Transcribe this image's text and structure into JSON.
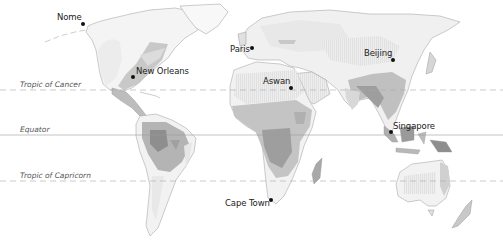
{
  "map": {
    "type": "world-climate-shading",
    "colors": {
      "background": "#ffffff",
      "land_base": "#f4f4f4",
      "land_light": "#e6e6e6",
      "land_medium": "#c8c8c8",
      "land_dark": "#a8a8a8",
      "land_darkest": "#8e8e8e",
      "coast": "#9a9a9a",
      "lat_line": "#9a9a9a"
    },
    "latitude_lines": [
      {
        "name": "Tropic of Cancer",
        "y": 90,
        "style": "dashed"
      },
      {
        "name": "Equator",
        "y": 135,
        "style": "solid"
      },
      {
        "name": "Tropic of Capricorn",
        "y": 181,
        "style": "dashed"
      }
    ],
    "cities": [
      {
        "name": "Nome",
        "x": 83,
        "y": 24
      },
      {
        "name": "New Orleans",
        "x": 133,
        "y": 77
      },
      {
        "name": "Paris",
        "x": 252,
        "y": 48
      },
      {
        "name": "Aswan",
        "x": 291,
        "y": 88
      },
      {
        "name": "Beijing",
        "x": 393,
        "y": 60
      },
      {
        "name": "Singapore",
        "x": 391,
        "y": 132
      },
      {
        "name": "Cape Town",
        "x": 271,
        "y": 200
      }
    ]
  }
}
